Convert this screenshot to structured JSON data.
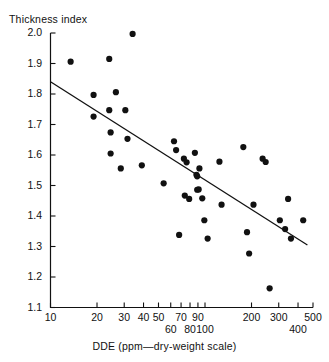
{
  "chart_data": {
    "type": "scatter",
    "title": "",
    "xlabel": "DDE (ppm—dry-weight scale)",
    "ylabel": "Thickness index",
    "xscale": "log",
    "yscale": "linear",
    "xlim": [
      10,
      500
    ],
    "ylim": [
      1.1,
      2.0
    ],
    "grid": false,
    "legend": null,
    "xticks_upper": [
      10,
      20,
      30,
      40,
      50,
      70,
      90,
      200,
      300,
      500
    ],
    "xticks_lower": [
      60,
      80,
      100,
      400
    ],
    "xtick_labels_upper": [
      "10",
      "20",
      "30",
      "40",
      "50",
      "70",
      "90",
      "200",
      "300",
      "500"
    ],
    "xtick_labels_lower": [
      "60",
      "80",
      "100",
      "400"
    ],
    "yticks": [
      1.1,
      1.2,
      1.3,
      1.4,
      1.5,
      1.6,
      1.7,
      1.8,
      1.9,
      2.0
    ],
    "ytick_labels": [
      "1.1",
      "1.2",
      "1.3",
      "1.4",
      "1.5",
      "1.6",
      "1.7",
      "1.8",
      "1.9",
      "2.0"
    ],
    "marker": "filled-circle",
    "marker_color": "#111111",
    "marker_size_px": 3.1,
    "series": [
      {
        "name": "Pelican eggshell samples",
        "points": [
          [
            13.5,
            1.906
          ],
          [
            19.0,
            1.797
          ],
          [
            19.0,
            1.726
          ],
          [
            24.0,
            1.915
          ],
          [
            24.0,
            1.747
          ],
          [
            24.5,
            1.674
          ],
          [
            24.5,
            1.605
          ],
          [
            26.5,
            1.806
          ],
          [
            28.5,
            1.556
          ],
          [
            30.5,
            1.747
          ],
          [
            31.5,
            1.653
          ],
          [
            34.0,
            1.997
          ],
          [
            39.0,
            1.566
          ],
          [
            54.0,
            1.507
          ],
          [
            63.0,
            1.645
          ],
          [
            65.0,
            1.616
          ],
          [
            68.0,
            1.338
          ],
          [
            73.0,
            1.588
          ],
          [
            74.0,
            1.467
          ],
          [
            76.0,
            1.576
          ],
          [
            79.0,
            1.456
          ],
          [
            86.0,
            1.607
          ],
          [
            88.0,
            1.535
          ],
          [
            89.0,
            1.53
          ],
          [
            89.0,
            1.486
          ],
          [
            91.0,
            1.487
          ],
          [
            92.0,
            1.556
          ],
          [
            96.0,
            1.458
          ],
          [
            99.0,
            1.386
          ],
          [
            104.0,
            1.326
          ],
          [
            124.0,
            1.578
          ],
          [
            128.0,
            1.437
          ],
          [
            177.0,
            1.626
          ],
          [
            187.0,
            1.347
          ],
          [
            193.0,
            1.277
          ],
          [
            206.0,
            1.437
          ],
          [
            236.0,
            1.588
          ],
          [
            247.0,
            1.577
          ],
          [
            262.0,
            1.163
          ],
          [
            305.0,
            1.386
          ],
          [
            330.0,
            1.357
          ],
          [
            345.0,
            1.456
          ],
          [
            360.0,
            1.326
          ],
          [
            432.0,
            1.386
          ]
        ]
      }
    ],
    "fit_line": {
      "type": "linear-in-log-x",
      "x_start": 10,
      "y_start": 1.84,
      "x_end": 460,
      "y_end": 1.305
    }
  }
}
